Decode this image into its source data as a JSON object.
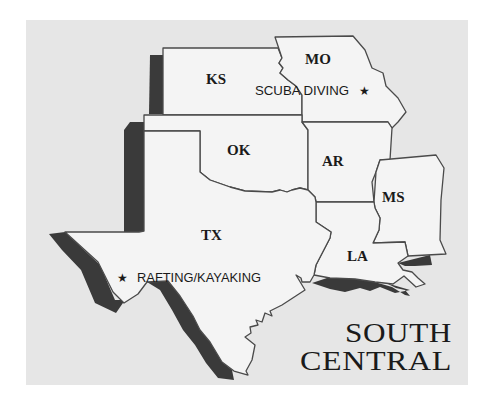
{
  "map": {
    "title_line1": "SOUTH",
    "title_line2": "CENTRAL",
    "background_color": "#e6e6e6",
    "state_fill": "#f4f4f4",
    "shadow_color": "#3a3a3a",
    "states": [
      {
        "abbr": "KS"
      },
      {
        "abbr": "MO"
      },
      {
        "abbr": "OK"
      },
      {
        "abbr": "AR"
      },
      {
        "abbr": "MS"
      },
      {
        "abbr": "TX"
      },
      {
        "abbr": "LA"
      }
    ],
    "points_of_interest": [
      {
        "label": "SCUBA DIVING",
        "icon": "star-icon",
        "glyph": "★",
        "state": "MO"
      },
      {
        "label": "RAFTING/KAYAKING",
        "icon": "star-icon",
        "glyph": "★",
        "state": "TX"
      }
    ]
  }
}
